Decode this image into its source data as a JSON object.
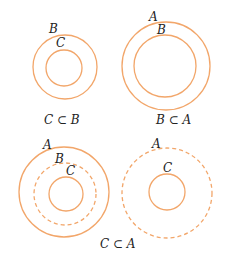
{
  "colors": {
    "circle": "#f2a66a",
    "text": "#222222"
  },
  "panels": [
    {
      "caption": "C ⊂ B",
      "circles": [
        {
          "label": "B",
          "cx": 65,
          "cy": 67,
          "r": 32,
          "dashed": false
        },
        {
          "label": "C",
          "cx": 64,
          "cy": 68,
          "r": 18,
          "dashed": false
        }
      ]
    },
    {
      "caption": "B ⊂ A",
      "circles": [
        {
          "label": "A",
          "cx": 166,
          "cy": 66,
          "r": 44,
          "dashed": false
        },
        {
          "label": "B",
          "cx": 165,
          "cy": 66,
          "r": 31,
          "dashed": false
        }
      ]
    },
    {
      "caption": "C ⊂ A",
      "circles": [
        {
          "label": "A",
          "cx": 64,
          "cy": 192,
          "r": 45,
          "dashed": false
        },
        {
          "label": "B",
          "cx": 65,
          "cy": 194,
          "r": 31,
          "dashed": true
        },
        {
          "label": "C",
          "cx": 66,
          "cy": 194,
          "r": 17,
          "dashed": false
        }
      ]
    },
    {
      "circles": [
        {
          "label": "A",
          "cx": 167,
          "cy": 193,
          "r": 45,
          "dashed": true
        },
        {
          "label": "C",
          "cx": 167,
          "cy": 192,
          "r": 18,
          "dashed": false
        }
      ]
    }
  ],
  "labels": {
    "p1_B": "B",
    "p1_C": "C",
    "p1_caption": "C ⊂ B",
    "p2_A": "A",
    "p2_B": "B",
    "p2_caption": "B ⊂ A",
    "p3_A": "A",
    "p3_B": "B",
    "p3_C": "C",
    "p4_A": "A",
    "p4_C": "C",
    "bottom_caption": "C ⊂ A"
  }
}
